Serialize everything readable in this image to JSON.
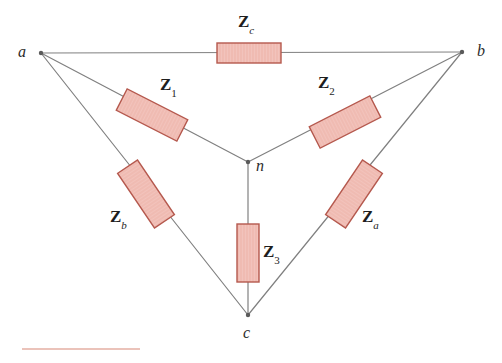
{
  "figure": {
    "type": "delta-wye-circuit-diagram",
    "background_color": "#ffffff",
    "wire_color": "#808080",
    "resistor_fill": "#f2c3bc",
    "resistor_stroke": "#b5594e",
    "label_color": "#1e1e1e"
  },
  "nodes": [
    {
      "id": "a",
      "label": "a",
      "x": 41,
      "y": 53,
      "label_x": 18,
      "label_y": 44
    },
    {
      "id": "b",
      "label": "b",
      "x": 462,
      "y": 52,
      "label_x": 477,
      "label_y": 43
    },
    {
      "id": "c",
      "label": "c",
      "x": 248,
      "y": 315,
      "label_x": 243,
      "label_y": 325
    },
    {
      "id": "n",
      "label": "n",
      "x": 248,
      "y": 162,
      "label_x": 256,
      "label_y": 158
    }
  ],
  "impedances": [
    {
      "id": "Zc",
      "main": "Z",
      "subscript": "c",
      "subscript_type": "letter",
      "branch": "a-b",
      "label_x": 238,
      "label_y": 13,
      "box": {
        "cx": 249,
        "cy": 53,
        "w": 64,
        "h": 20,
        "rotation": 0
      }
    },
    {
      "id": "Z1",
      "main": "Z",
      "subscript": "1",
      "subscript_type": "numeric",
      "branch": "a-n",
      "label_x": 160,
      "label_y": 76,
      "box": {
        "cx": 152,
        "cy": 115,
        "w": 68,
        "h": 24,
        "rotation": 27
      }
    },
    {
      "id": "Z2",
      "main": "Z",
      "subscript": "2",
      "subscript_type": "numeric",
      "branch": "b-n",
      "label_x": 318,
      "label_y": 74,
      "box": {
        "cx": 345,
        "cy": 122,
        "w": 68,
        "h": 24,
        "rotation": -27
      }
    },
    {
      "id": "Z3",
      "main": "Z",
      "subscript": "3",
      "subscript_type": "numeric",
      "branch": "n-c",
      "label_x": 263,
      "label_y": 243,
      "box": {
        "cx": 248,
        "cy": 253,
        "w": 22,
        "h": 58,
        "rotation": 0
      }
    },
    {
      "id": "Zb",
      "main": "Z",
      "subscript": "b",
      "subscript_type": "letter",
      "branch": "a-c",
      "label_x": 110,
      "label_y": 208,
      "box": {
        "cx": 146,
        "cy": 194,
        "w": 66,
        "h": 24,
        "rotation": 56
      }
    },
    {
      "id": "Za",
      "main": "Z",
      "subscript": "a",
      "subscript_type": "letter",
      "branch": "b-c",
      "label_x": 362,
      "label_y": 208,
      "box": {
        "cx": 354,
        "cy": 194,
        "w": 66,
        "h": 24,
        "rotation": -56
      }
    }
  ],
  "wires": [
    {
      "id": "wire-a-b",
      "x1": 41,
      "y1": 53,
      "x2": 462,
      "y2": 52
    },
    {
      "id": "wire-a-n",
      "x1": 41,
      "y1": 53,
      "x2": 248,
      "y2": 162
    },
    {
      "id": "wire-b-n",
      "x1": 462,
      "y1": 52,
      "x2": 248,
      "y2": 162
    },
    {
      "id": "wire-n-c",
      "x1": 248,
      "y1": 162,
      "x2": 248,
      "y2": 315
    },
    {
      "id": "wire-a-c",
      "x1": 41,
      "y1": 53,
      "x2": 248,
      "y2": 315
    },
    {
      "id": "wire-b-c",
      "x1": 462,
      "y1": 52,
      "x2": 248,
      "y2": 315
    }
  ],
  "bottom_rule": {
    "x": 22,
    "y": 348,
    "width": 118,
    "color": "#e8b9ae"
  }
}
